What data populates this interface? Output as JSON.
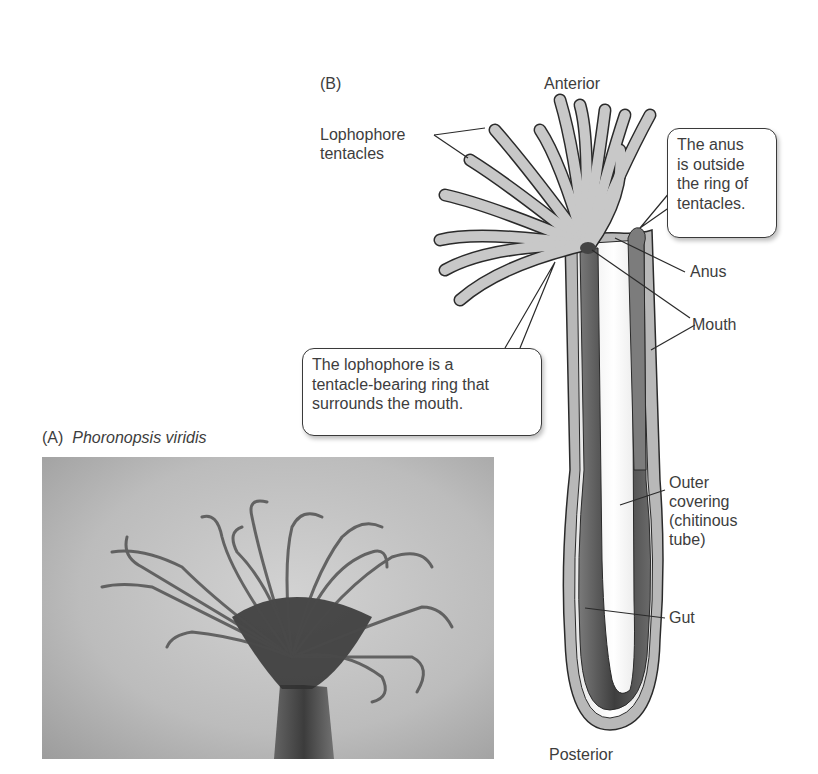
{
  "panel_a": {
    "letter": "(A)",
    "species": "Phoronopsis viridis",
    "image_description": "Grayscale photograph of a phoronid worm with a crown of curled lophophore tentacles on top of a tube-like body"
  },
  "panel_b": {
    "letter": "(B)",
    "labels": {
      "anterior": "Anterior",
      "posterior": "Posterior",
      "lophophore_tentacles_line1": "Lophophore",
      "lophophore_tentacles_line2": "tentacles",
      "anus": "Anus",
      "mouth": "Mouth",
      "outer_covering_line1": "Outer",
      "outer_covering_line2": "covering",
      "outer_covering_line3": "(chitinous",
      "outer_covering_line4": "tube)",
      "gut": "Gut"
    },
    "callouts": {
      "anus_note": [
        "The anus",
        "is outside",
        "the ring of",
        "tentacles."
      ],
      "lophophore_note": [
        "The lophophore is a",
        "tentacle-bearing ring that",
        "surrounds the mouth."
      ]
    }
  },
  "colors": {
    "tentacle_fill": "#c8c8c8",
    "gut_dark": "#5a5a5a",
    "tube_light": "#b0b0b0",
    "outline": "#2a2a2a",
    "text": "#3d3d3d"
  }
}
